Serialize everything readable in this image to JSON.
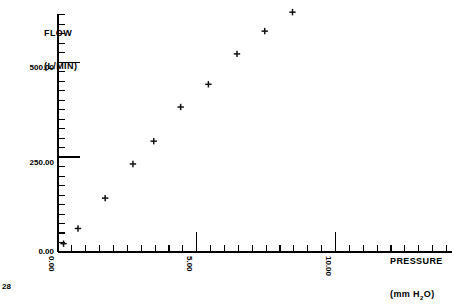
{
  "chart_data": {
    "type": "scatter",
    "title": "",
    "ylabel": "FLOW\n(L/MIN)",
    "ylabel_line1": "FLOW",
    "ylabel_line2": "(L/MIN)",
    "xlabel_line1": "PRESSURE",
    "xlabel_line2": "(mm H2O)",
    "xlabel_prefix": "(mm H",
    "xlabel_sub": "2",
    "xlabel_suffix": "O)",
    "xlim": [
      0.0,
      11.0
    ],
    "ylim": [
      0.0,
      600.0
    ],
    "xticks_major": [
      0.0,
      5.0,
      10.0
    ],
    "xtick_labels": [
      "0.00",
      "5.00",
      "10.00"
    ],
    "yticks_major": [
      0.0,
      250.0,
      500.0
    ],
    "ytick_labels": [
      "0.00",
      "250.00",
      "500.00"
    ],
    "x_minor_step": 0.5,
    "y_minor_step": 25.0,
    "grid": false,
    "legend": false,
    "marker": "plus",
    "marker_color": "#111111",
    "axis_color": "#000000",
    "x": [
      0.2,
      0.72,
      1.7,
      2.7,
      3.45,
      4.42,
      5.42,
      6.45,
      7.45,
      8.45,
      9.0,
      10.0
    ],
    "y": [
      22,
      62,
      142,
      232,
      292,
      382,
      442,
      522,
      582,
      632,
      682,
      730
    ],
    "points": [
      {
        "x": 0.2,
        "y": 22
      },
      {
        "x": 0.72,
        "y": 62
      },
      {
        "x": 1.7,
        "y": 142
      },
      {
        "x": 2.7,
        "y": 232
      },
      {
        "x": 3.45,
        "y": 292
      },
      {
        "x": 4.42,
        "y": 382
      },
      {
        "x": 5.42,
        "y": 442
      },
      {
        "x": 6.45,
        "y": 522
      },
      {
        "x": 7.45,
        "y": 582
      },
      {
        "x": 8.45,
        "y": 632
      },
      {
        "x": 9.0,
        "y": 682
      },
      {
        "x": 10.0,
        "y": 730
      }
    ]
  },
  "labels": {
    "y_title_l1": "FLOW",
    "y_title_l2": "(L/MIN)",
    "x_title_l1": "PRESSURE",
    "x_title_l2_pre": "(mm H",
    "x_title_l2_sub": "2",
    "x_title_l2_post": "O)",
    "y0": "0.00",
    "y250": "250.00",
    "y500": "500.00",
    "x0": "0.00",
    "x5": "5.00",
    "x10": "10.00"
  },
  "footer": {
    "page_number": "28"
  }
}
